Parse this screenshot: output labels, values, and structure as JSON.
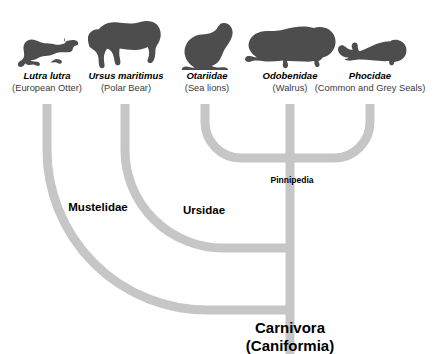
{
  "diagram": {
    "title_remnant": "",
    "type": "phylogenetic-tree",
    "branch_color": "#c6c6c6",
    "silhouette_color": "#4d4d4d",
    "text_color": "#000000"
  },
  "taxa": [
    {
      "icon": "otter-silhouette",
      "scientific_name": "Lutra lutra",
      "common_name": "(European Otter)"
    },
    {
      "icon": "polar-bear-silhouette",
      "scientific_name": "Ursus maritimus",
      "common_name": "(Polar Bear)"
    },
    {
      "icon": "sea-lion-silhouette",
      "scientific_name": "Otariidae",
      "common_name": "(Sea lions)"
    },
    {
      "icon": "walrus-silhouette",
      "scientific_name": "Odobenidae",
      "common_name": "(Walrus)"
    },
    {
      "icon": "seal-silhouette",
      "scientific_name": "Phocidae",
      "common_name": "(Common and Grey Seals)"
    }
  ],
  "clades": [
    {
      "label": "Pinnipedia"
    },
    {
      "label": "Mustelidae"
    },
    {
      "label": "Ursidae"
    }
  ],
  "root": {
    "name": "Carnivora",
    "subname": "(Caniformia)"
  }
}
